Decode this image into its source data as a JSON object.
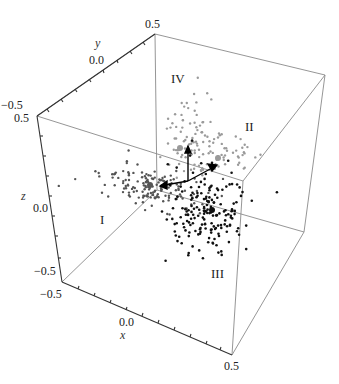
{
  "chart_data": {
    "type": "scatter3d",
    "title": "",
    "axes": {
      "x": {
        "label": "x",
        "range": [
          -0.5,
          0.5
        ],
        "ticks": [
          "-0.5",
          "0.0",
          "0.5"
        ]
      },
      "y": {
        "label": "y",
        "range": [
          -0.5,
          0.5
        ],
        "ticks": [
          "-0.5",
          "0.0",
          "0.5"
        ]
      },
      "z": {
        "label": "z",
        "range": [
          -0.5,
          0.5
        ],
        "ticks": [
          "-0.5",
          "0.0",
          "0.5"
        ]
      }
    },
    "grid": false,
    "box": true,
    "regions": [
      {
        "label": "I",
        "description": "dark-gray cluster, left-center"
      },
      {
        "label": "II",
        "description": "light-gray cluster, upper right"
      },
      {
        "label": "III",
        "description": "black cluster, lower right"
      },
      {
        "label": "IV",
        "description": "light-gray cluster, upper center"
      }
    ],
    "series": [
      {
        "name": "I",
        "color": "#555555",
        "approx_points": 150
      },
      {
        "name": "II/IV",
        "color": "#999999",
        "approx_points": 150
      },
      {
        "name": "III",
        "color": "#111111",
        "approx_points": 180
      }
    ],
    "annotations": [
      "three arrows from origin (principal axes)"
    ]
  },
  "labels": {
    "x_axis": "x",
    "y_axis": "y",
    "z_axis": "z",
    "x_ticks": [
      "−0.5",
      "0.0",
      "0.5"
    ],
    "y_ticks": [
      "−0.5",
      "0.0",
      "0.5"
    ],
    "z_ticks": [
      "0.5",
      "0.0",
      "−0.5"
    ],
    "region_I": "I",
    "region_II": "II",
    "region_III": "III",
    "region_IV": "IV"
  },
  "colors": {
    "box": "#8a8a8a",
    "axis": "#333333",
    "cluster_I": "#555555",
    "cluster_II_IV": "#9a9a9a",
    "cluster_III": "#111111"
  }
}
